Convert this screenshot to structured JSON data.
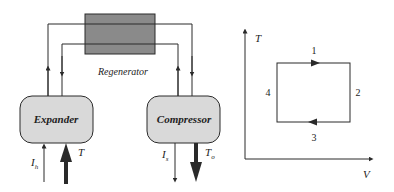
{
  "colors": {
    "line": "#2a2a2a",
    "regenerator_fill": "#8a8a8a",
    "component_fill": "#d9d9d9",
    "background": "#ffffff"
  },
  "schematic": {
    "regenerator": {
      "label": "Regenerator"
    },
    "expander": {
      "label": "Expander",
      "inputs": [
        {
          "label": "I",
          "subscript": "h",
          "arrow": "thin-up"
        },
        {
          "label": "T",
          "subscript": "",
          "arrow": "thick-up"
        }
      ]
    },
    "compressor": {
      "label": "Compressor",
      "outputs": [
        {
          "label": "I",
          "subscript": "s",
          "arrow": "thin-down"
        },
        {
          "label": "T",
          "subscript": "o",
          "arrow": "thick-down"
        }
      ]
    }
  },
  "cycle_diagram": {
    "y_axis_label": "T",
    "x_axis_label": "V",
    "states": [
      {
        "id": "1",
        "position": "top"
      },
      {
        "id": "2",
        "position": "right"
      },
      {
        "id": "3",
        "position": "bottom"
      },
      {
        "id": "4",
        "position": "left"
      }
    ],
    "direction": "clockwise"
  }
}
